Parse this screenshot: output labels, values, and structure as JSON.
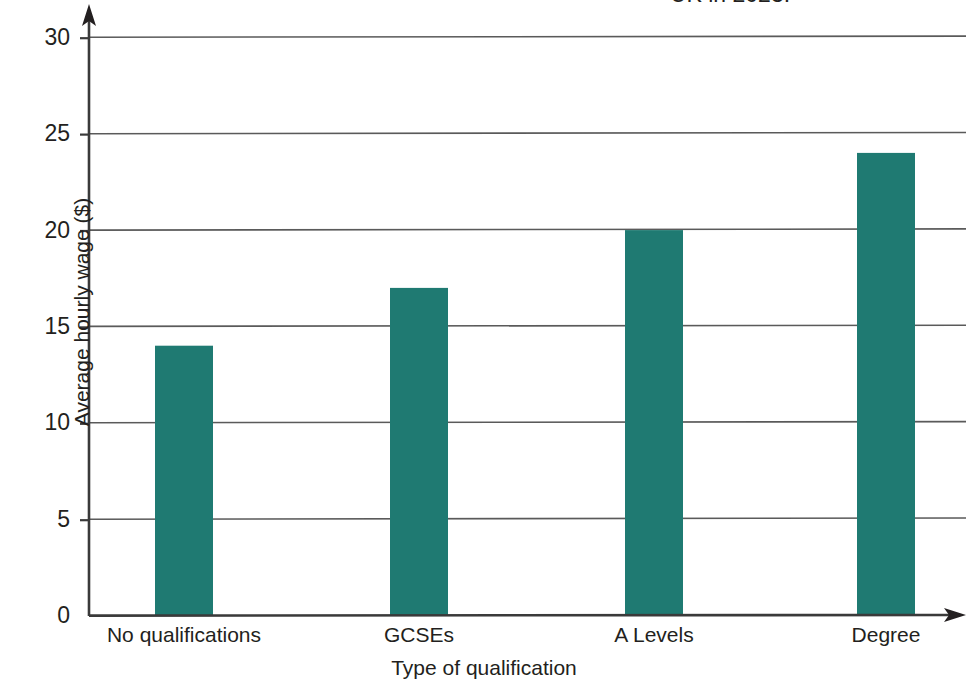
{
  "figure": {
    "title_partial": "UK in 2023.",
    "title_note": "top of caption cropped off by screenshot edge"
  },
  "chart_data": {
    "type": "bar",
    "title": "UK in 2023.",
    "categories": [
      "No qualifications",
      "GCSEs",
      "A Levels",
      "Degree"
    ],
    "values": [
      14,
      17,
      20,
      24
    ],
    "xlabel": "Type of qualification",
    "ylabel": "Average hourly wage ($)",
    "ylim": [
      0,
      31
    ],
    "yticks": [
      0,
      5,
      10,
      15,
      20,
      25,
      30
    ],
    "ytick_labels": [
      "0",
      "5",
      "10",
      "15",
      "20",
      "25",
      "30"
    ],
    "grid": true,
    "grid_axis": "y",
    "legend": null,
    "bar_color": "#1f7a72",
    "axis_color": "#3a3a3a",
    "grid_color": "#5a5a5a",
    "axis_arrows": true
  },
  "axes": {
    "y": {
      "label": "Average hourly wage ($)",
      "ticks": [
        {
          "label": "30",
          "value": 30
        },
        {
          "label": "25",
          "value": 25
        },
        {
          "label": "20",
          "value": 20
        },
        {
          "label": "15",
          "value": 15
        },
        {
          "label": "10",
          "value": 10
        },
        {
          "label": "5",
          "value": 5
        },
        {
          "label": "0",
          "value": 0
        }
      ]
    },
    "x": {
      "label": "Type of qualification",
      "ticks": [
        {
          "label": "No qualifications"
        },
        {
          "label": "GCSEs"
        },
        {
          "label": "A Levels"
        },
        {
          "label": "Degree"
        }
      ]
    }
  }
}
